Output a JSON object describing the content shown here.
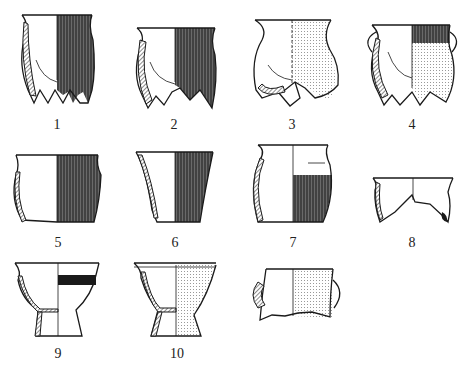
{
  "figure": {
    "type": "archaeological pottery line-drawing plate",
    "background": "#ffffff",
    "ink": "#1a1a1a",
    "vessels": [
      {
        "id": 1,
        "label": "1",
        "form": "tripod li (hollow-legged cooking vessel)",
        "surface": "vertical cord-marked, dark"
      },
      {
        "id": 2,
        "label": "2",
        "form": "tripod li with flared rim",
        "surface": "cord-marked, dark"
      },
      {
        "id": 3,
        "label": "3",
        "form": "tripod li, squat with broad lobes",
        "surface": "sparse cord-marks"
      },
      {
        "id": 4,
        "label": "4",
        "form": "double-handled tripod li",
        "surface": "cord-marked with incised band at rim"
      },
      {
        "id": 5,
        "label": "5",
        "form": "deep jar with everted rim",
        "surface": "curved comb / cord pattern, dark"
      },
      {
        "id": 6,
        "label": "6",
        "form": "tapered deep bowl",
        "surface": "cord-marked, dark"
      },
      {
        "id": 7,
        "label": "7",
        "form": "globular jar",
        "surface": "cord-marked lower body"
      },
      {
        "id": 8,
        "label": "8",
        "form": "shallow bowl fragment",
        "surface": "mostly plain"
      },
      {
        "id": 9,
        "label": "9",
        "form": "pedestal bowl (dou)",
        "surface": "painted dark band below rim"
      },
      {
        "id": 10,
        "label": "10",
        "form": "pedestal bowl (dou)",
        "surface": "plain stippled"
      },
      {
        "id": 11,
        "label": "",
        "form": "double-handled cup fragment",
        "surface": "stippled"
      }
    ]
  }
}
